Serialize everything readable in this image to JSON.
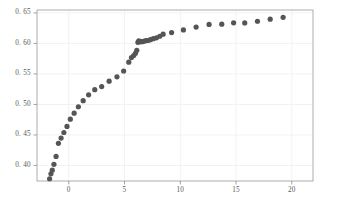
{
  "chart_data": {
    "type": "scatter",
    "title": "",
    "subtitle": "",
    "xlabel": "",
    "ylabel": "",
    "xlim": [
      -2.85,
      21.9
    ],
    "ylim": [
      0.3745,
      0.6548
    ],
    "xticks": [
      0,
      5,
      10,
      15,
      20
    ],
    "xtick_labels": [
      "0",
      "5",
      "10",
      "15",
      "20"
    ],
    "yticks": [
      0.4,
      0.45,
      0.5,
      0.55,
      0.6,
      0.65
    ],
    "ytick_labels": [
      "0. 40",
      "0. 45",
      "0. 50",
      "0. 55",
      "0. 60",
      "0. 65"
    ],
    "grid": true,
    "grid_axis": "y",
    "legend": "none",
    "marker": "circle",
    "marker_color": "#555555",
    "marker_size": 2.6,
    "series": [
      {
        "name": "series-1",
        "x": [
          -1.72,
          -1.6,
          -1.48,
          -1.33,
          -1.14,
          -0.93,
          -0.69,
          -0.44,
          -0.16,
          0.14,
          0.48,
          0.86,
          1.29,
          1.78,
          2.33,
          2.95,
          3.62,
          4.32,
          4.92,
          5.38,
          5.62,
          5.82,
          5.98,
          6.1,
          6.2,
          6.28,
          6.36,
          6.46,
          6.58,
          6.72,
          6.9,
          7.1,
          7.32,
          7.58,
          7.86,
          8.16,
          8.46,
          9.22,
          10.28,
          11.42,
          12.58,
          13.72,
          14.78,
          15.78,
          16.92,
          18.06,
          19.22
        ],
        "y": [
          0.3782,
          0.3862,
          0.3922,
          0.4018,
          0.4148,
          0.4362,
          0.4448,
          0.454,
          0.464,
          0.4758,
          0.4856,
          0.4962,
          0.5062,
          0.5158,
          0.5242,
          0.5292,
          0.5382,
          0.5452,
          0.5548,
          0.5692,
          0.5768,
          0.5802,
          0.5838,
          0.5888,
          0.6018,
          0.6042,
          0.6028,
          0.603,
          0.6028,
          0.6036,
          0.6046,
          0.6048,
          0.6062,
          0.6078,
          0.6092,
          0.6118,
          0.6152,
          0.6178,
          0.6222,
          0.6268,
          0.6312,
          0.6316,
          0.6338,
          0.6336,
          0.6364,
          0.6398,
          0.6428
        ]
      }
    ]
  },
  "style": {
    "background": "#ffffff",
    "frame_color": "#9a9a9a",
    "grid_color": "#f2f2f4",
    "tick_color": "#8c8c8c",
    "label_color": "#585858"
  },
  "layout": {
    "plot_left": 37,
    "plot_right": 313,
    "plot_top": 10,
    "plot_bottom": 181
  }
}
